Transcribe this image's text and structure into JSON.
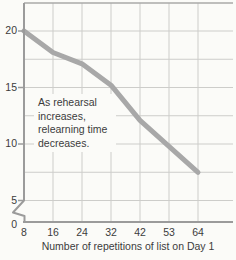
{
  "chart_data": {
    "type": "line",
    "title": "",
    "x": [
      8,
      16,
      24,
      32,
      42,
      53,
      64
    ],
    "x_tick_labels": [
      "8",
      "16",
      "24",
      "32",
      "42",
      "53",
      "64"
    ],
    "series": [
      {
        "name": "Relearning time",
        "values": [
          20,
          18.1,
          17.1,
          15.2,
          12.1,
          9.8,
          7.5
        ]
      }
    ],
    "xlabel": "Number of repetitions of list on Day 1",
    "ylabel": "",
    "y_ticks": [
      20,
      15,
      10,
      5,
      0
    ],
    "ylim": [
      0,
      22.5
    ],
    "y_axis_break_between": [
      0,
      5
    ],
    "grid": true,
    "legend_position": "none",
    "annotation": "As rehearsal increases, relearning time decreases."
  },
  "axes": {
    "y_tick_labels": [
      "20",
      "15",
      "10",
      "5",
      "0"
    ],
    "x_tick_labels": [
      "8",
      "16",
      "24",
      "32",
      "42",
      "53",
      "64"
    ],
    "x_axis_title": "Number of repetitions of list on Day 1"
  },
  "annotation": {
    "lines": [
      "As rehearsal",
      "increases,",
      "relearning time",
      "decreases."
    ]
  },
  "colors": {
    "background": "#fbfbf8",
    "gridline": "#cdcdca",
    "axis": "#9b9b9b",
    "top_border": "#aaaaa8",
    "data_line": "#a8a8a8",
    "text": "#3c3c3c"
  }
}
